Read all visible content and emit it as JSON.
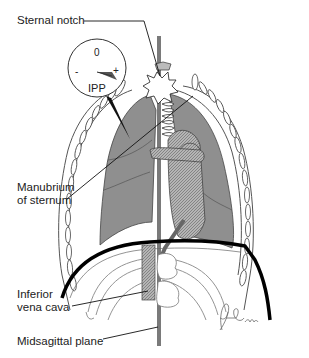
{
  "diagram": {
    "type": "anatomical-illustration"
  },
  "labels": {
    "sternal_notch": "Sternal notch",
    "manubrium_line1": "Manubrium",
    "manubrium_line2": "of sternum",
    "ivc_line1": "Inferior",
    "ivc_line2": "vena cava",
    "midsagittal": "Midsagittal plane"
  },
  "gauge": {
    "zero": "0",
    "minus": "-",
    "plus": "+",
    "name": "IPP"
  },
  "signature": "Brodie",
  "colors": {
    "lung": "#8f8f8f",
    "outline": "#555555",
    "diaphragm": "#000000",
    "vessel": "#a0a0a0",
    "background": "#ffffff"
  }
}
